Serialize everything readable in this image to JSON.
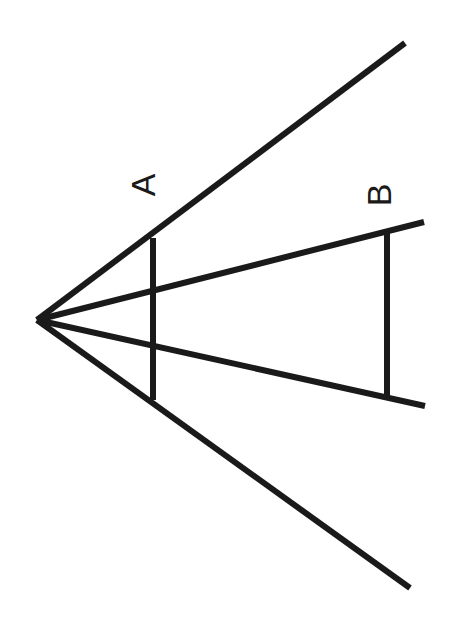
{
  "figure": {
    "type": "ponzo-illusion",
    "background": "#ffffff",
    "stroke_color": "#1a1a1a",
    "vertex": {
      "x": 37,
      "y": 320
    },
    "rays": [
      {
        "name": "outer-top",
        "x2": 405,
        "y2": 43
      },
      {
        "name": "inner-top",
        "x2": 424,
        "y2": 222
      },
      {
        "name": "inner-bottom",
        "x2": 425,
        "y2": 406
      },
      {
        "name": "outer-bottom",
        "x2": 410,
        "y2": 588
      }
    ],
    "segments": [
      {
        "label": "A",
        "x": 153,
        "y1": 238,
        "y2": 400
      },
      {
        "label": "B",
        "x": 387,
        "y1": 233,
        "y2": 396
      }
    ]
  },
  "labels": {
    "a": "A",
    "b": "B"
  }
}
